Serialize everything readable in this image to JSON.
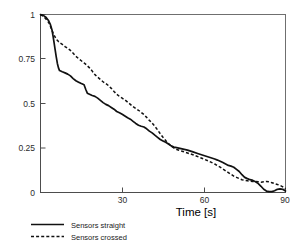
{
  "chart_data": {
    "type": "line",
    "title": "",
    "xlabel": "Time [s]",
    "ylabel": "",
    "xlim": [
      0,
      90
    ],
    "ylim": [
      0,
      1
    ],
    "xticks": [
      30,
      60,
      90
    ],
    "xticklabels": [
      "30",
      "60",
      "90"
    ],
    "yticks": [
      0,
      0.25,
      0.5,
      0.75,
      1
    ],
    "yticklabels": [
      "0",
      "0.25",
      "0.5",
      "0.75",
      "1"
    ],
    "grid": false,
    "legend_position": "below-left",
    "series": [
      {
        "name": "Sensors straight",
        "style": "solid",
        "color": "#111111",
        "x": [
          0,
          1.0,
          2.0,
          3.0,
          3.6,
          4.2,
          4.6,
          5.0,
          5.4,
          5.8,
          6.2,
          6.6,
          7.0,
          8.0,
          9.0,
          10.0,
          11.0,
          12.0,
          13.0,
          14.0,
          15.0,
          16.0,
          16.6,
          17.2,
          18.0,
          19.0,
          20.0,
          21.0,
          22.0,
          23.0,
          24.0,
          25.0,
          26.0,
          27.0,
          28.0,
          29.0,
          30.0,
          31.0,
          32.0,
          33.0,
          34.0,
          35.0,
          36.0,
          37.0,
          38.0,
          39.0,
          40.0,
          41.0,
          42.0,
          43.0,
          44.0,
          45.0,
          46.0,
          47.0,
          48.0,
          49.0,
          50.0,
          52.0,
          54.0,
          56.0,
          58.0,
          60.0,
          62.0,
          64.0,
          65.0,
          66.0,
          67.0,
          68.0,
          69.0,
          70.0,
          71.0,
          72.0,
          73.0,
          74.0,
          75.0,
          76.0,
          77.0,
          78.0,
          79.0,
          80.0,
          81.0,
          82.0,
          83.0,
          84.0,
          85.0,
          86.0,
          87.0,
          88.0,
          89.0,
          90.0
        ],
        "y": [
          1.0,
          0.995,
          0.985,
          0.965,
          0.945,
          0.915,
          0.88,
          0.84,
          0.8,
          0.76,
          0.725,
          0.7,
          0.685,
          0.678,
          0.672,
          0.665,
          0.655,
          0.64,
          0.628,
          0.62,
          0.612,
          0.605,
          0.58,
          0.558,
          0.552,
          0.545,
          0.54,
          0.53,
          0.518,
          0.505,
          0.495,
          0.488,
          0.478,
          0.468,
          0.455,
          0.448,
          0.44,
          0.43,
          0.42,
          0.412,
          0.4,
          0.388,
          0.378,
          0.372,
          0.368,
          0.358,
          0.345,
          0.335,
          0.322,
          0.31,
          0.298,
          0.29,
          0.282,
          0.272,
          0.262,
          0.255,
          0.252,
          0.245,
          0.238,
          0.228,
          0.218,
          0.208,
          0.198,
          0.188,
          0.182,
          0.175,
          0.168,
          0.16,
          0.152,
          0.148,
          0.142,
          0.13,
          0.118,
          0.1,
          0.085,
          0.078,
          0.072,
          0.068,
          0.06,
          0.05,
          0.035,
          0.018,
          0.008,
          0.005,
          0.005,
          0.01,
          0.018,
          0.02,
          0.018,
          0.008
        ]
      },
      {
        "name": "Sensors crossed",
        "style": "dashed",
        "color": "#111111",
        "x": [
          0,
          1.0,
          2.0,
          3.0,
          3.6,
          4.2,
          4.8,
          5.4,
          6.0,
          6.6,
          7.2,
          8.0,
          9.0,
          10.0,
          11.0,
          12.0,
          13.0,
          14.0,
          15.0,
          16.0,
          17.0,
          18.0,
          19.0,
          20.0,
          21.0,
          22.0,
          23.0,
          24.0,
          25.0,
          26.0,
          27.0,
          28.0,
          29.0,
          30.0,
          31.0,
          32.0,
          33.0,
          34.0,
          35.0,
          36.0,
          37.0,
          38.0,
          39.0,
          40.0,
          41.0,
          42.0,
          43.0,
          44.0,
          45.0,
          46.0,
          47.0,
          48.0,
          49.0,
          50.0,
          52.0,
          54.0,
          56.0,
          58.0,
          60.0,
          62.0,
          64.0,
          66.0,
          68.0,
          69.0,
          70.0,
          71.0,
          72.0,
          73.0,
          74.0,
          75.0,
          76.0,
          77.0,
          78.0,
          79.0,
          80.0,
          81.0,
          82.0,
          83.0,
          84.0,
          85.0,
          86.0,
          87.0,
          88.0,
          89.0,
          90.0
        ],
        "y": [
          1.0,
          0.99,
          0.975,
          0.955,
          0.935,
          0.912,
          0.89,
          0.872,
          0.858,
          0.848,
          0.84,
          0.832,
          0.82,
          0.81,
          0.798,
          0.782,
          0.765,
          0.752,
          0.74,
          0.728,
          0.715,
          0.7,
          0.682,
          0.662,
          0.648,
          0.635,
          0.622,
          0.612,
          0.6,
          0.585,
          0.568,
          0.552,
          0.54,
          0.53,
          0.52,
          0.508,
          0.495,
          0.482,
          0.472,
          0.462,
          0.45,
          0.438,
          0.422,
          0.405,
          0.39,
          0.372,
          0.352,
          0.33,
          0.31,
          0.292,
          0.275,
          0.262,
          0.25,
          0.242,
          0.232,
          0.222,
          0.212,
          0.2,
          0.188,
          0.175,
          0.16,
          0.142,
          0.122,
          0.112,
          0.102,
          0.092,
          0.085,
          0.078,
          0.072,
          0.068,
          0.066,
          0.064,
          0.062,
          0.062,
          0.06,
          0.058,
          0.06,
          0.062,
          0.06,
          0.055,
          0.05,
          0.045,
          0.04,
          0.032,
          0.02
        ]
      }
    ]
  },
  "legend": {
    "entries": [
      {
        "label": "Sensors straight",
        "style": "solid"
      },
      {
        "label": "Sensors crossed",
        "style": "dashed"
      }
    ]
  },
  "colors": {
    "line": "#111111",
    "axis": "#4d4d4d",
    "frame": "#6f6f6f",
    "background": "#ffffff"
  }
}
